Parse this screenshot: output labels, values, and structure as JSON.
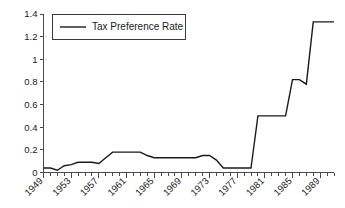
{
  "chart_data": {
    "type": "line",
    "title": "",
    "subtitle": "",
    "xlabel": "",
    "ylabel": "",
    "xlim": [
      1949,
      1991
    ],
    "ylim": [
      0,
      1.4
    ],
    "grid": false,
    "legend_position": "top-left",
    "y_ticks": [
      "0",
      "0.2",
      "0.4",
      "0.6",
      "0.8",
      "1",
      "1.2",
      "1.4"
    ],
    "y_tick_values": [
      0,
      0.2,
      0.4,
      0.6,
      0.8,
      1.0,
      1.2,
      1.4
    ],
    "x_tick_labels": [
      "1949",
      "1953",
      "1957",
      "1961",
      "1965",
      "1969",
      "1973",
      "1977",
      "1981",
      "1985",
      "1989"
    ],
    "x_tick_values": [
      1949,
      1953,
      1957,
      1961,
      1965,
      1969,
      1973,
      1977,
      1981,
      1985,
      1989
    ],
    "x_minor_ticks_every": 1,
    "series": [
      {
        "name": "Tax Preference Rate",
        "color": "#1a1a1a",
        "x": [
          1949,
          1950,
          1951,
          1952,
          1953,
          1954,
          1955,
          1956,
          1957,
          1958,
          1959,
          1960,
          1961,
          1962,
          1963,
          1964,
          1965,
          1966,
          1967,
          1968,
          1969,
          1970,
          1971,
          1972,
          1973,
          1974,
          1975,
          1976,
          1977,
          1978,
          1979,
          1980,
          1981,
          1982,
          1983,
          1984,
          1985,
          1986,
          1987,
          1988,
          1989,
          1990,
          1991
        ],
        "values": [
          0.04,
          0.04,
          0.02,
          0.06,
          0.07,
          0.09,
          0.09,
          0.09,
          0.08,
          0.13,
          0.18,
          0.18,
          0.18,
          0.18,
          0.18,
          0.15,
          0.13,
          0.13,
          0.13,
          0.13,
          0.13,
          0.13,
          0.13,
          0.15,
          0.15,
          0.11,
          0.04,
          0.04,
          0.04,
          0.04,
          0.04,
          0.5,
          0.5,
          0.5,
          0.5,
          0.5,
          0.82,
          0.82,
          0.78,
          1.33,
          1.33,
          1.33,
          1.33
        ]
      }
    ]
  },
  "legend": {
    "entries": [
      {
        "label": "Tax Preference Rate"
      }
    ]
  }
}
